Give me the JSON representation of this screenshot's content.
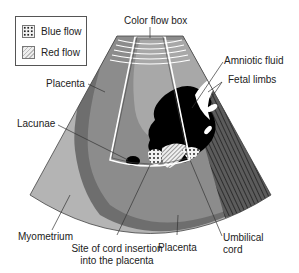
{
  "legend": {
    "items": [
      {
        "label": "Blue flow",
        "pattern": "dotted"
      },
      {
        "label": "Red flow",
        "pattern": "hatched"
      }
    ]
  },
  "labels": {
    "color_flow_box": "Color flow box",
    "amniotic_fluid": "Amniotic fluid",
    "fetal_limbs": "Fetal limbs",
    "placenta_top": "Placenta",
    "lacunae": "Lacunae",
    "myometrium": "Myometrium",
    "site_line1": "Site of cord insertion",
    "site_line2": "into the placenta",
    "placenta_bottom": "Placenta",
    "umbilical_line1": "Umbilical",
    "umbilical_line2": "cord"
  },
  "colors": {
    "myometrium": "#b4b4b4",
    "placenta": "#8c8c8c",
    "placenta_dark": "#6e6e6e",
    "fetus": "#000000",
    "fetal_limb": "#5a5a5a",
    "background": "#ffffff"
  }
}
